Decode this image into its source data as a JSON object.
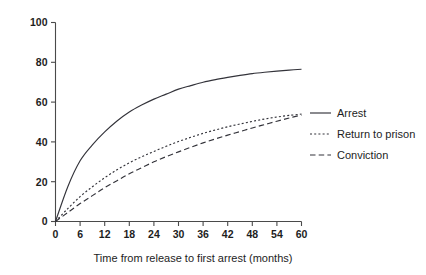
{
  "chart_data": {
    "type": "line",
    "title": "",
    "subtitle": "",
    "xlabel": "Time from release to first arrest (months)",
    "ylabel": "",
    "xlim": [
      0,
      60
    ],
    "ylim": [
      0,
      100
    ],
    "grid": false,
    "legend_position": "right",
    "x_ticks": [
      0,
      6,
      12,
      18,
      24,
      30,
      36,
      42,
      48,
      54,
      60
    ],
    "x_tick_labels": [
      "0",
      "6",
      "12",
      "18",
      "24",
      "30",
      "36",
      "42",
      "48",
      "54",
      "60"
    ],
    "y_ticks": [
      0,
      20,
      40,
      60,
      80,
      100
    ],
    "y_tick_labels": [
      "0",
      "20",
      "40",
      "60",
      "80",
      "100"
    ],
    "x": [
      0,
      3,
      6,
      9,
      12,
      15,
      18,
      21,
      24,
      27,
      30,
      33,
      36,
      39,
      42,
      45,
      48,
      51,
      54,
      57,
      60
    ],
    "series": [
      {
        "name": "Arrest",
        "style": "solid",
        "color": "#33333a",
        "values": [
          0,
          17.5,
          30.5,
          38.5,
          45.0,
          50.5,
          55.0,
          58.5,
          61.5,
          64.0,
          66.5,
          68.3,
          70.0,
          71.3,
          72.4,
          73.4,
          74.3,
          75.0,
          75.6,
          76.1,
          76.5
        ]
      },
      {
        "name": "Return to prison",
        "style": "dotted",
        "color": "#33333a",
        "values": [
          0,
          6.5,
          12.5,
          17.5,
          22.0,
          26.0,
          29.5,
          32.5,
          35.2,
          37.8,
          40.2,
          42.3,
          44.3,
          46.0,
          47.6,
          49.0,
          50.3,
          51.5,
          52.5,
          53.3,
          54.0
        ]
      },
      {
        "name": "Conviction",
        "style": "dashed",
        "color": "#33333a",
        "values": [
          0,
          4.5,
          9.0,
          13.0,
          17.0,
          20.5,
          24.0,
          27.0,
          30.0,
          32.6,
          35.0,
          37.3,
          39.5,
          41.5,
          43.4,
          45.2,
          47.0,
          48.7,
          50.4,
          52.0,
          53.5
        ]
      }
    ],
    "legend_entries": [
      {
        "label": "Arrest",
        "style": "solid"
      },
      {
        "label": "Return to prison",
        "style": "dotted"
      },
      {
        "label": "Conviction",
        "style": "dashed"
      }
    ]
  }
}
